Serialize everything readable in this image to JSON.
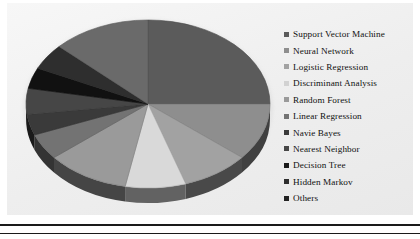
{
  "chart_data": {
    "type": "pie",
    "title": "",
    "legend_position": "right",
    "labels": [
      "Support Vector Machine",
      "Neural Network",
      "Logistic Regression",
      "Discriminant Analysis",
      "Random Forest",
      "Linear Regression",
      "Navie Bayes",
      "Nearest Neighbor",
      "Decision Tree",
      "Hidden Markov",
      "Others"
    ],
    "values": [
      25,
      11,
      9,
      8,
      11,
      5,
      4,
      5,
      4,
      5,
      13
    ],
    "colors": [
      "#5b5b5b",
      "#8e8e8e",
      "#a2a2a2",
      "#d9d9d9",
      "#9a9a9a",
      "#737373",
      "#3a3a3a",
      "#464646",
      "#111111",
      "#2e2e2e",
      "#6a6a6a"
    ],
    "start_angle_deg": 0,
    "direction": "clockwise",
    "three_d": true
  },
  "legend": {
    "items": [
      {
        "label": "Support Vector Machine",
        "color": "#5b5b5b"
      },
      {
        "label": "Neural Network",
        "color": "#8e8e8e"
      },
      {
        "label": "Logistic Regression",
        "color": "#a2a2a2"
      },
      {
        "label": "Discriminant Analysis",
        "color": "#d2d2d2"
      },
      {
        "label": "Random Forest",
        "color": "#9a9a9a"
      },
      {
        "label": "Linear Regression",
        "color": "#737373"
      },
      {
        "label": "Navie Bayes",
        "color": "#3a3a3a"
      },
      {
        "label": "Nearest Neighbor",
        "color": "#464646"
      },
      {
        "label": "Decision Tree",
        "color": "#1a1a1a"
      },
      {
        "label": "Hidden Markov",
        "color": "#2e2e2e"
      },
      {
        "label": "Others",
        "color": "#222222"
      }
    ]
  },
  "figure": {
    "background": "#f1f1f1",
    "page_background": "#ffffff",
    "rule_color": "#1a1a1a"
  }
}
